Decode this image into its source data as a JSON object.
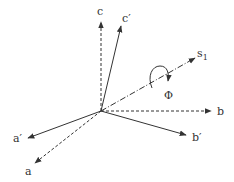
{
  "diagram": {
    "origin": [
      101,
      111
    ],
    "axes": [
      {
        "id": "a",
        "label": "a",
        "style": "dashed",
        "tip": [
          35,
          163
        ],
        "label_pos": [
          25,
          175
        ]
      },
      {
        "id": "b",
        "label": "b",
        "style": "dashed",
        "tip": [
          211,
          111
        ],
        "label_pos": [
          217,
          115
        ]
      },
      {
        "id": "c",
        "label": "c",
        "style": "dashed",
        "tip": [
          101,
          22
        ],
        "label_pos": [
          97,
          15
        ]
      },
      {
        "id": "a_prime",
        "label": "a′",
        "style": "solid",
        "tip": [
          28,
          138
        ],
        "label_pos": [
          13,
          142
        ]
      },
      {
        "id": "b_prime",
        "label": "b′",
        "style": "solid",
        "tip": [
          186,
          135
        ],
        "label_pos": [
          192,
          141
        ]
      },
      {
        "id": "c_prime",
        "label": "c′",
        "style": "solid",
        "tip": [
          121,
          26
        ],
        "label_pos": [
          122,
          22
        ]
      },
      {
        "id": "s1",
        "label": "s",
        "subscript": "1",
        "style": "dashdot",
        "tip": [
          195,
          58
        ],
        "label_pos": [
          197,
          57
        ]
      }
    ],
    "rotation": {
      "label": "Φ",
      "label_pos": [
        164,
        99
      ]
    },
    "colors": {
      "line": "#333333",
      "background": "#ffffff"
    }
  }
}
